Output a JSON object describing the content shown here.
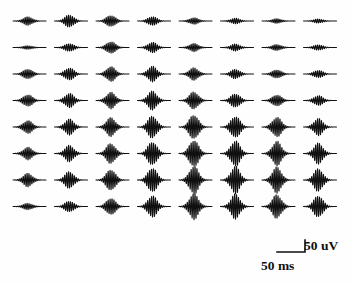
{
  "figure": {
    "type": "waveform-array",
    "background_color": "#fefefe",
    "trace_color": "#101010",
    "rows": 8,
    "columns": 8
  },
  "scalebar": {
    "amplitude_label": "50 uV",
    "time_label": "50 ms",
    "amplitude_value": 50,
    "amplitude_unit": "uV",
    "time_value": 50,
    "time_unit": "ms",
    "horizontal_length_px": 28,
    "vertical_length_px": 12,
    "origin_x": 277,
    "origin_y": 252,
    "color": "#101010"
  },
  "chart_data": {
    "type": "line",
    "title": "",
    "subtitle": "",
    "xlabel": "",
    "ylabel": "",
    "grid": false,
    "legend": "none",
    "layout": {
      "rows": 8,
      "cols": 8,
      "cell_width": 40,
      "cell_height": 26.5,
      "trace_width": 33,
      "origin_x": 13,
      "origin_y": 21,
      "col_pitch": 41.5,
      "row_pitch": 26.5
    },
    "axis_scale": {
      "x_per_px_ms": 1.7857,
      "y_per_px_uv": 4.1667,
      "note": "Scale derived from 50 ms = 28 px horizontally and 50 uV = 12 px vertically"
    },
    "waveform_model": {
      "description": "Each cell shows a damped oscillatory burst: a Gaussian-enveloped sinusoid",
      "cycles": 17,
      "envelope": "gaussian",
      "envelope_center_fraction": 0.45,
      "envelope_width_fraction": 0.26,
      "duration_ms": 59
    },
    "series": [
      {
        "name": "row-1",
        "amplitudes_uv": [
          17,
          25,
          23,
          18,
          13,
          11,
          9,
          8
        ]
      },
      {
        "name": "row-2",
        "amplitudes_uv": [
          7,
          16,
          24,
          21,
          16,
          14,
          12,
          11
        ]
      },
      {
        "name": "row-3",
        "amplitudes_uv": [
          20,
          25,
          30,
          31,
          25,
          19,
          17,
          15
        ]
      },
      {
        "name": "row-4",
        "amplitudes_uv": [
          24,
          29,
          33,
          38,
          35,
          28,
          23,
          20
        ]
      },
      {
        "name": "row-5",
        "amplitudes_uv": [
          26,
          32,
          38,
          45,
          50,
          44,
          40,
          34
        ]
      },
      {
        "name": "row-6",
        "amplitudes_uv": [
          25,
          33,
          41,
          48,
          55,
          52,
          49,
          42
        ]
      },
      {
        "name": "row-7",
        "amplitudes_uv": [
          27,
          34,
          43,
          50,
          57,
          55,
          52,
          46
        ]
      },
      {
        "name": "row-8",
        "amplitudes_uv": [
          13,
          22,
          34,
          44,
          52,
          50,
          48,
          44
        ]
      }
    ],
    "annotations": [
      {
        "text": "50 uV",
        "role": "vertical-scale-label"
      },
      {
        "text": "50 ms",
        "role": "horizontal-scale-label"
      }
    ]
  }
}
